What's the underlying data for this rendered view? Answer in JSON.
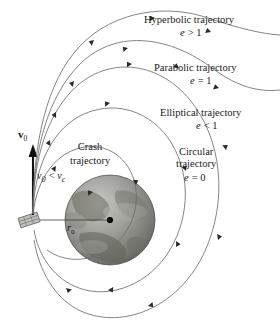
{
  "figure": {
    "background_color": "#ffffff",
    "curve_color": "#6e6e6e",
    "arrow_color": "#2a2a2a",
    "text_color": "#1a1a1a",
    "width": 280,
    "height": 332
  },
  "labels": {
    "hyperbolic": {
      "name_line1": "Hyperbolic trajectory",
      "ecc_symbol": "e",
      "ecc_relation": "> 1",
      "ecc_full": "e > 1"
    },
    "parabolic": {
      "name_line1": "Parabolic trajectory",
      "ecc_symbol": "e",
      "ecc_relation": "= 1",
      "ecc_full": "e = 1"
    },
    "elliptical": {
      "name_line1": "Elliptical trajectory",
      "ecc_symbol": "e",
      "ecc_relation": "< 1",
      "ecc_full": "e < 1"
    },
    "circular": {
      "name_line1": "Circular",
      "name_line2": "trajectory",
      "ecc_symbol": "e",
      "ecc_relation": "= 0",
      "ecc_full": "e = 0"
    },
    "crash": {
      "name_line1": "Crash",
      "name_line2": "trajectory"
    },
    "velocity_vector": {
      "symbol": "v",
      "subscript": "0"
    },
    "speed_condition": {
      "symbol": "v",
      "subscript": "0",
      "relation": "<",
      "symbol2": "v",
      "subscript2": "c",
      "full": "v0 < vc"
    },
    "radius": {
      "symbol": "r",
      "subscript": "0"
    }
  },
  "elements": {
    "planet": {
      "name": "planet",
      "center_dot": "center-of-mass-dot",
      "fill": "#9a9a9a"
    },
    "launch_pad": {
      "name": "launch-platform"
    }
  }
}
